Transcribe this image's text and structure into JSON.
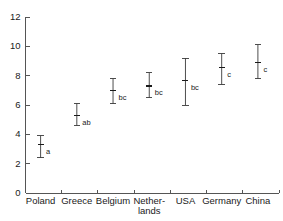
{
  "chart_data": {
    "type": "scatter",
    "title": "",
    "subtitle": "",
    "xlabel": "",
    "ylabel": "",
    "ylim": [
      0,
      12
    ],
    "y_ticks": [
      0,
      2,
      4,
      6,
      8,
      10,
      12
    ],
    "y_tick_labels": [
      "0",
      "2",
      "4",
      "6",
      "8",
      "10",
      "12"
    ],
    "grid": false,
    "legend": false,
    "legend_position": "none",
    "categories": [
      "Poland",
      "Greece",
      "Belgium",
      "Nether-\nlands",
      "USA",
      "Germany",
      "China"
    ],
    "category_labels_wrapped": [
      [
        "Poland"
      ],
      [
        "Greece"
      ],
      [
        "Belgium"
      ],
      [
        "Nether-",
        "lands"
      ],
      [
        "USA"
      ],
      [
        "Germany"
      ],
      [
        "China"
      ]
    ],
    "series": [
      {
        "name": "mean",
        "values": [
          3.3,
          5.3,
          7.0,
          7.3,
          7.65,
          8.55,
          8.9
        ]
      },
      {
        "name": "lower",
        "values": [
          2.4,
          4.6,
          6.1,
          6.5,
          6.0,
          7.4,
          7.8
        ]
      },
      {
        "name": "upper",
        "values": [
          3.9,
          6.1,
          7.8,
          8.2,
          9.2,
          9.5,
          10.1
        ]
      }
    ],
    "annotations": [
      "a",
      "ab",
      "bc",
      "bc",
      "bc",
      "c",
      "c"
    ],
    "points": [
      {
        "category": "Poland",
        "mean": 3.3,
        "lower": 2.4,
        "upper": 3.9,
        "letter": "a"
      },
      {
        "category": "Greece",
        "mean": 5.3,
        "lower": 4.6,
        "upper": 6.1,
        "letter": "ab"
      },
      {
        "category": "Belgium",
        "mean": 7.0,
        "lower": 6.1,
        "upper": 7.8,
        "letter": "bc"
      },
      {
        "category": "Netherlands",
        "mean": 7.3,
        "lower": 6.5,
        "upper": 8.2,
        "letter": "bc"
      },
      {
        "category": "USA",
        "mean": 7.65,
        "lower": 6.0,
        "upper": 9.2,
        "letter": "bc"
      },
      {
        "category": "Germany",
        "mean": 8.55,
        "lower": 7.4,
        "upper": 9.5,
        "letter": "c"
      },
      {
        "category": "China",
        "mean": 8.9,
        "lower": 7.8,
        "upper": 10.1,
        "letter": "c"
      }
    ],
    "colors": {
      "axis": "#555555",
      "errorbar": "#3a3a3a",
      "marker": "#1a1a1a",
      "text": "#1a1a1a",
      "background": "#ffffff"
    }
  },
  "cut_text": {
    "left": "",
    "right": ""
  }
}
